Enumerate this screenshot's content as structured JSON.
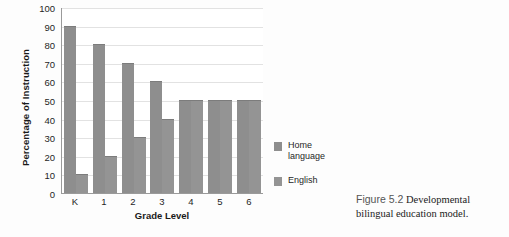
{
  "chart_data": {
    "type": "bar",
    "title": "",
    "xlabel": "Grade Level",
    "ylabel": "Percentage of Instruction",
    "categories": [
      "K",
      "1",
      "2",
      "3",
      "4",
      "5",
      "6"
    ],
    "series": [
      {
        "name": "Home language",
        "values": [
          90,
          80,
          70,
          60,
          50,
          50,
          50
        ],
        "color": "#8e8e8e"
      },
      {
        "name": "English",
        "values": [
          10,
          20,
          30,
          40,
          50,
          50,
          50
        ],
        "color": "#949494"
      }
    ],
    "ylim": [
      0,
      100
    ],
    "yticks": [
      100,
      90,
      80,
      70,
      60,
      50,
      40,
      30,
      20,
      10,
      0
    ],
    "grid": true,
    "legend_position": "right"
  },
  "legend": {
    "items": [
      {
        "label": "Home language"
      },
      {
        "label": "English"
      }
    ]
  },
  "caption": {
    "number": "Figure 5.2",
    "text": "Developmental bilingual education model."
  }
}
